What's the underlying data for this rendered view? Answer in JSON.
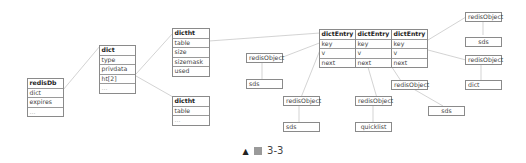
{
  "diagram": {
    "redisDb": {
      "title": "redisDb",
      "fields": [
        "dict",
        "expires",
        "..."
      ]
    },
    "dict": {
      "title": "dict",
      "fields": [
        "type",
        "privdata",
        "ht[2]",
        "..."
      ]
    },
    "dictht_0": {
      "title": "dictht",
      "fields": [
        "table",
        "size",
        "sizemask",
        "used"
      ]
    },
    "dictht_1": {
      "title": "dictht",
      "fields": [
        "table",
        "..."
      ]
    },
    "dictEntries": [
      {
        "title": "dictEntry",
        "fields": [
          "key",
          "v",
          "next"
        ]
      },
      {
        "title": "dictEntry",
        "fields": [
          "key",
          "v",
          "next"
        ]
      },
      {
        "title": "dictEntry",
        "fields": [
          "key",
          "v",
          "next"
        ]
      }
    ],
    "nodes": {
      "redisObject_a": "redisObject",
      "sds_a": "sds",
      "redisObject_b": "redisObject",
      "sds_b": "sds",
      "redisObject_c": "redisObject",
      "quicklist": "quicklist",
      "redisObject_d": "redisObject",
      "sds_c": "sds",
      "redisObject_e": "redisObject",
      "sds_d": "sds",
      "redisObject_f": "redisObject",
      "dict_leaf": "dict"
    }
  },
  "caption": {
    "marker": "▲",
    "figure_label": "图",
    "number": "3-3"
  }
}
